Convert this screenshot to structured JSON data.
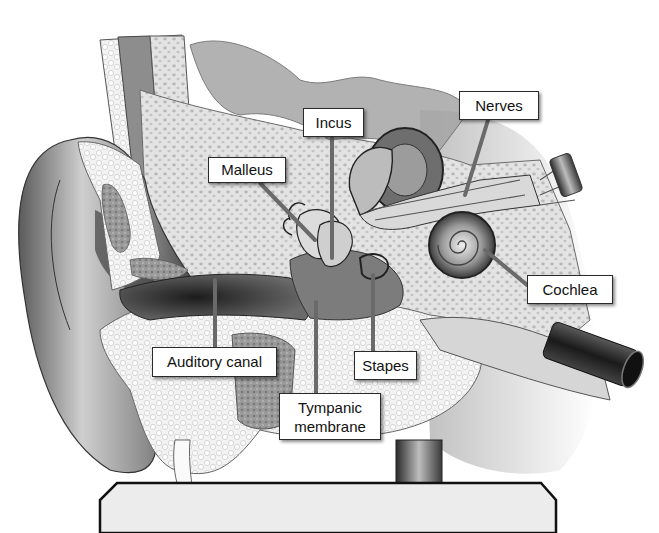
{
  "figure": {
    "style": "grayscale anatomical illustration",
    "colors": {
      "background": "#ffffff",
      "label_bg": "#ffffff",
      "label_border": "#2a2a2a",
      "pointer": "#6a6a6a",
      "stand": "#ececec",
      "stand_border": "#111111"
    }
  },
  "labels": [
    {
      "id": "malleus",
      "text": "Malleus",
      "box": [
        208,
        157,
        78,
        26
      ],
      "pointer_to": [
        318,
        242
      ]
    },
    {
      "id": "incus",
      "text": "Incus",
      "box": [
        303,
        108,
        61,
        29
      ],
      "pointer_to": [
        332,
        260
      ]
    },
    {
      "id": "nerves",
      "text": "Nerves",
      "box": [
        459,
        91,
        80,
        29
      ],
      "pointer_to": [
        465,
        195
      ]
    },
    {
      "id": "cochlea",
      "text": "Cochlea",
      "box": [
        527,
        275,
        86,
        29
      ],
      "pointer_to": [
        483,
        245
      ]
    },
    {
      "id": "auditory-canal",
      "text": "Auditory canal",
      "box": [
        152,
        347,
        125,
        30
      ],
      "pointer_to": [
        215,
        275
      ]
    },
    {
      "id": "stapes",
      "text": "Stapes",
      "box": [
        354,
        351,
        63,
        29
      ],
      "pointer_to": [
        372,
        272
      ]
    },
    {
      "id": "tympanic-membrane",
      "text": "Tympanic membrane",
      "line1": "Tympanic",
      "line2": "membrane",
      "box": [
        279,
        393,
        102,
        47
      ],
      "pointer_to": [
        316,
        300
      ]
    }
  ]
}
